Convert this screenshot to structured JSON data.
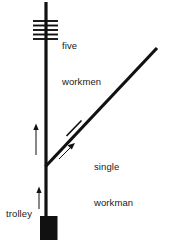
{
  "diagram": {
    "type": "trolley-problem-schematic",
    "background_color": "#ffffff",
    "stroke_color": "#111111",
    "text_color": "#1a1a1a",
    "labels": {
      "five_workmen_line1": "five",
      "five_workmen_line2": "workmen",
      "single_workman_line1": "single",
      "single_workman_line2": "workman",
      "trolley": "trolley"
    },
    "elements": {
      "main_track": {
        "name": "main-track",
        "x1": 46,
        "y1": 2,
        "x2": 46,
        "y2": 222,
        "stroke_width": 3.2
      },
      "branch_track": {
        "name": "branch-track",
        "x1": 46,
        "y1": 166,
        "x2": 157,
        "y2": 48,
        "stroke_width": 3.2
      },
      "five_workmen_ties": {
        "name": "five-workmen-ties",
        "count": 5,
        "x_left": 33,
        "x_right": 58,
        "y_values": [
          21,
          25.5,
          30,
          34.5,
          39
        ],
        "stroke_width": 1.8
      },
      "single_workman_tie": {
        "name": "single-workman-tie",
        "x1": 67,
        "y1": 135,
        "x2": 81,
        "y2": 121,
        "stroke_width": 1.6
      },
      "trolley_car": {
        "name": "trolley-car",
        "x": 40,
        "y": 216,
        "width": 17,
        "height": 24,
        "fill": "#111111"
      },
      "direction_arrow_upper": {
        "name": "direction-arrow-upper",
        "x": 36,
        "y_tail": 155,
        "y_head": 126
      },
      "direction_arrow_lower": {
        "name": "direction-arrow-lower",
        "x": 39,
        "y_tail": 208,
        "y_head": 188
      },
      "branch_direction_arrow": {
        "name": "branch-direction-arrow",
        "x1": 60,
        "y1": 158,
        "x2": 74,
        "y2": 144
      }
    }
  }
}
